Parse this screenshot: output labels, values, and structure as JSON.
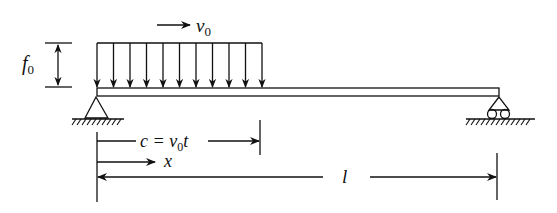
{
  "diagram": {
    "type": "simply-supported beam with moving distributed load",
    "colors": {
      "line": "#111111",
      "background": "#ffffff"
    },
    "labels": {
      "load_height": {
        "main": "f",
        "sub": "0"
      },
      "velocity": {
        "main": "v",
        "sub": "0"
      },
      "load_position": {
        "prefix": "c = v",
        "sub": "0",
        "suffix": "t"
      },
      "coordinate": "x",
      "length": "l"
    },
    "load": {
      "arrow_count": 11,
      "direction": "down"
    },
    "supports": [
      {
        "name": "left",
        "kind": "pin"
      },
      {
        "name": "right",
        "kind": "roller"
      }
    ]
  }
}
